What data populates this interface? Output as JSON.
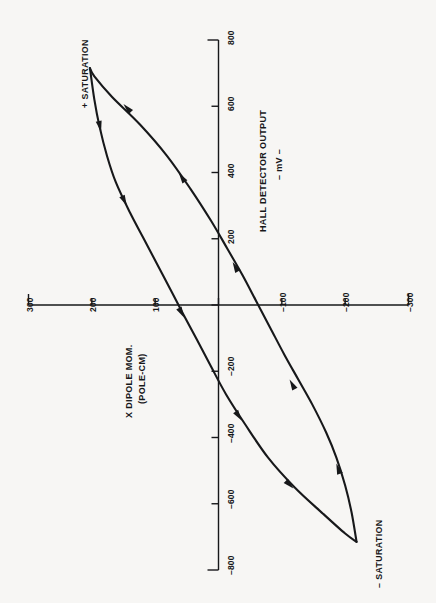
{
  "page": {
    "background_color": "#f7f6f4",
    "ink_color": "#17181a",
    "orientation_note": "rotated-90"
  },
  "chart_data": {
    "type": "line",
    "subtype": "hysteresis-loop",
    "title": "",
    "xlabel": "X DIPOLE MOM. (POLE-CM)",
    "ylabel": "HALL DETECTOR OUTPUT  - mV -",
    "ylabel_line1": "HALL DETECTOR OUTPUT",
    "ylabel_line2": "– mV –",
    "xlabel_line1": "X DIPOLE MOM.",
    "xlabel_line2": "(POLE-CM)",
    "xlim": [
      -300,
      300
    ],
    "ylim": [
      -800,
      800
    ],
    "xticks": [
      300,
      200,
      100,
      0,
      -100,
      -200,
      -300
    ],
    "xtick_labels": [
      "300",
      "200",
      "100",
      "",
      "–100",
      "–200",
      "–300"
    ],
    "yticks": [
      800,
      600,
      400,
      200,
      0,
      -200,
      -400,
      -600,
      -800
    ],
    "ytick_labels": [
      "800",
      "600",
      "400",
      "200",
      "",
      "–200",
      "–400",
      "–600",
      "–800"
    ],
    "grid": false,
    "legend": false,
    "annotations": [
      {
        "text": "+ SATURATION",
        "x": 203,
        "y": 715
      },
      {
        "text": "– SATURATION",
        "x": -218,
        "y": -715
      }
    ],
    "series": [
      {
        "name": "descending-branch",
        "direction": "from + saturation toward – saturation",
        "points": [
          [
            203,
            715
          ],
          [
            196,
            620
          ],
          [
            188,
            540
          ],
          [
            176,
            450
          ],
          [
            162,
            370
          ],
          [
            140,
            280
          ],
          [
            118,
            200
          ],
          [
            96,
            120
          ],
          [
            74,
            40
          ],
          [
            55,
            -30
          ],
          [
            34,
            -105
          ],
          [
            12,
            -185
          ],
          [
            -12,
            -270
          ],
          [
            -42,
            -360
          ],
          [
            -78,
            -460
          ],
          [
            -120,
            -550
          ],
          [
            -165,
            -630
          ],
          [
            -200,
            -690
          ],
          [
            -218,
            -715
          ]
        ]
      },
      {
        "name": "ascending-branch",
        "direction": "from – saturation toward + saturation",
        "points": [
          [
            -218,
            -715
          ],
          [
            -210,
            -625
          ],
          [
            -200,
            -545
          ],
          [
            -186,
            -460
          ],
          [
            -170,
            -385
          ],
          [
            -148,
            -300
          ],
          [
            -126,
            -225
          ],
          [
            -104,
            -150
          ],
          [
            -82,
            -70
          ],
          [
            -60,
            10
          ],
          [
            -38,
            90
          ],
          [
            -14,
            170
          ],
          [
            12,
            255
          ],
          [
            44,
            350
          ],
          [
            82,
            452
          ],
          [
            124,
            545
          ],
          [
            168,
            628
          ],
          [
            196,
            690
          ],
          [
            203,
            715
          ]
        ]
      }
    ],
    "arrow_markers": [
      {
        "series": "descending-branch",
        "x": 188,
        "y": 545
      },
      {
        "series": "descending-branch",
        "x": 150,
        "y": 320
      },
      {
        "series": "descending-branch",
        "x": 60,
        "y": -18
      },
      {
        "series": "descending-branch",
        "x": -30,
        "y": -330
      },
      {
        "series": "descending-branch",
        "x": -110,
        "y": -538
      },
      {
        "series": "ascending-branch",
        "x": -190,
        "y": -500
      },
      {
        "series": "ascending-branch",
        "x": -118,
        "y": -245
      },
      {
        "series": "ascending-branch",
        "x": -28,
        "y": 110
      },
      {
        "series": "ascending-branch",
        "x": 56,
        "y": 380
      },
      {
        "series": "ascending-branch",
        "x": 142,
        "y": 590
      }
    ]
  }
}
